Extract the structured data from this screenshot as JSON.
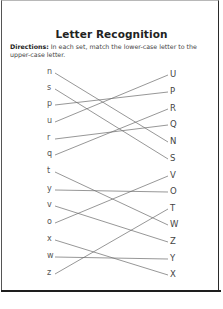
{
  "worksheet": {
    "title": "Letter Recognition",
    "directions_label": "Directions:",
    "directions_text": " In each set, match the lower-case letter to the upper-case letter.",
    "line_color": "#6a6a6a",
    "left_letters": [
      {
        "char": "n",
        "y": 73
      },
      {
        "char": "s",
        "y": 89
      },
      {
        "char": "p",
        "y": 105
      },
      {
        "char": "u",
        "y": 122
      },
      {
        "char": "r",
        "y": 139
      },
      {
        "char": "q",
        "y": 155
      },
      {
        "char": "t",
        "y": 172
      },
      {
        "char": "y",
        "y": 190
      },
      {
        "char": "v",
        "y": 206
      },
      {
        "char": "o",
        "y": 223
      },
      {
        "char": "x",
        "y": 240
      },
      {
        "char": "w",
        "y": 257
      },
      {
        "char": "z",
        "y": 274
      }
    ],
    "right_letters": [
      {
        "char": "U",
        "y": 75
      },
      {
        "char": "P",
        "y": 92
      },
      {
        "char": "R",
        "y": 109
      },
      {
        "char": "Q",
        "y": 125
      },
      {
        "char": "N",
        "y": 142
      },
      {
        "char": "S",
        "y": 159
      },
      {
        "char": "V",
        "y": 176
      },
      {
        "char": "O",
        "y": 192
      },
      {
        "char": "T",
        "y": 209
      },
      {
        "char": "W",
        "y": 225
      },
      {
        "char": "Z",
        "y": 242
      },
      {
        "char": "Y",
        "y": 259
      },
      {
        "char": "X",
        "y": 275
      }
    ],
    "matches": [
      {
        "from": "n",
        "to": "N"
      },
      {
        "from": "s",
        "to": "S"
      },
      {
        "from": "p",
        "to": "P"
      },
      {
        "from": "u",
        "to": "U"
      },
      {
        "from": "r",
        "to": "Q"
      },
      {
        "from": "q",
        "to": "R"
      },
      {
        "from": "t",
        "to": "W"
      },
      {
        "from": "y",
        "to": "O"
      },
      {
        "from": "v",
        "to": "Z"
      },
      {
        "from": "o",
        "to": "V"
      },
      {
        "from": "x",
        "to": "X"
      },
      {
        "from": "w",
        "to": "Y"
      },
      {
        "from": "z",
        "to": "T"
      }
    ]
  }
}
